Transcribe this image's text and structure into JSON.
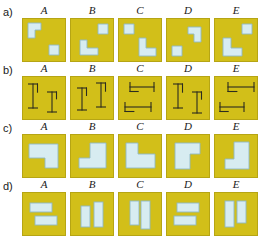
{
  "figure": {
    "title": "",
    "columns": [
      "A",
      "B",
      "C",
      "D",
      "E"
    ],
    "row_labels": [
      "a)",
      "b)",
      "c)",
      "d)"
    ],
    "colors": {
      "tile_fill": "#d2bf19",
      "tile_stroke": "#b6a514",
      "shape_fill": "#d7ecf1",
      "shape_stroke": "#8fb9c4",
      "line_color": "#2b2b20",
      "background": "#ffffff",
      "text": "#1a1a1a"
    },
    "rows": [
      {
        "label": "a)",
        "kind": "small-polyomino-pair",
        "cells": [
          {
            "column": "A",
            "shapes": [
              {
                "name": "l-shape",
                "points": "6,5 19,5 19,12 13,12 13,20 6,20"
              },
              {
                "name": "small-square",
                "points": "27,27 37,27 37,37 27,37"
              }
            ]
          },
          {
            "column": "B",
            "shapes": [
              {
                "name": "small-square",
                "points": "28,6 38,6 38,16 28,16"
              },
              {
                "name": "l-shape",
                "points": "10,22 17,22 17,30 28,30 28,37 10,37"
              }
            ]
          },
          {
            "column": "C",
            "shapes": [
              {
                "name": "small-square",
                "points": "6,6 16,6 16,16 6,16"
              },
              {
                "name": "l-shape",
                "points": "21,20 28,20 28,30 38,30 38,38 21,38"
              }
            ]
          },
          {
            "column": "D",
            "shapes": [
              {
                "name": "l-shape",
                "points": "22,9 35,9 35,24 28,24 28,16 22,16"
              },
              {
                "name": "small-square",
                "points": "6,28 16,28 16,38 6,38"
              }
            ]
          },
          {
            "column": "E",
            "shapes": [
              {
                "name": "small-square",
                "points": "28,6 38,6 38,16 28,16"
              },
              {
                "name": "l-shape",
                "points": "9,20 17,20 17,30 28,30 28,38 9,38"
              }
            ]
          }
        ]
      },
      {
        "label": "b)",
        "kind": "ibeam-pair",
        "cells": [
          {
            "column": "A",
            "beams": [
              {
                "name": "ibeam-vertical",
                "orient": "v",
                "x": 11,
                "y": 8,
                "len": 24,
                "cap": 9
              },
              {
                "name": "ibeam-vertical",
                "orient": "v",
                "x": 30,
                "y": 16,
                "len": 20,
                "cap": 9
              }
            ]
          },
          {
            "column": "B",
            "beams": [
              {
                "name": "ibeam-vertical",
                "orient": "v",
                "x": 12,
                "y": 12,
                "len": 22,
                "cap": 9
              },
              {
                "name": "ibeam-vertical",
                "orient": "v",
                "x": 31,
                "y": 7,
                "len": 24,
                "cap": 9
              }
            ]
          },
          {
            "column": "C",
            "beams": [
              {
                "name": "ibeam-horizontal",
                "orient": "h",
                "x": 12,
                "y": 11,
                "len": 24,
                "cap": 9
              },
              {
                "name": "ibeam-horizontal",
                "orient": "h",
                "x": 7,
                "y": 31,
                "len": 26,
                "cap": 9
              }
            ]
          },
          {
            "column": "D",
            "beams": [
              {
                "name": "ibeam-vertical",
                "orient": "v",
                "x": 12,
                "y": 8,
                "len": 24,
                "cap": 9
              },
              {
                "name": "ibeam-vertical",
                "orient": "v",
                "x": 31,
                "y": 16,
                "len": 21,
                "cap": 9
              }
            ]
          },
          {
            "column": "E",
            "beams": [
              {
                "name": "ibeam-horizontal",
                "orient": "h",
                "x": 14,
                "y": 11,
                "len": 26,
                "cap": 9
              },
              {
                "name": "ibeam-horizontal",
                "orient": "h",
                "x": 6,
                "y": 31,
                "len": 24,
                "cap": 9
              }
            ]
          }
        ]
      },
      {
        "label": "c)",
        "kind": "large-step-polygon",
        "cells": [
          {
            "column": "A",
            "shape": {
              "name": "step-polygon",
              "points": "7,10 36,10 36,34 23,34 23,24 7,24"
            }
          },
          {
            "column": "B",
            "shape": {
              "name": "step-polygon",
              "points": "20,9 36,9 36,34 9,34 9,24 20,24"
            }
          },
          {
            "column": "C",
            "shape": {
              "name": "step-polygon",
              "points": "8,9 20,9 20,20 37,20 37,34 8,34"
            }
          },
          {
            "column": "D",
            "shape": {
              "name": "step-polygon",
              "points": "9,9 34,9 34,20 24,20 24,35 9,35"
            }
          },
          {
            "column": "E",
            "shape": {
              "name": "step-polygon",
              "points": "20,8 35,8 35,35 11,35 11,25 20,25"
            }
          }
        ]
      },
      {
        "label": "d)",
        "kind": "rectangle-pair",
        "cells": [
          {
            "column": "A",
            "rects": [
              {
                "name": "rect-horizontal",
                "x": 8,
                "y": 11,
                "w": 22,
                "h": 9
              },
              {
                "name": "rect-horizontal",
                "x": 13,
                "y": 24,
                "w": 22,
                "h": 9
              }
            ]
          },
          {
            "column": "B",
            "rects": [
              {
                "name": "rect-vertical",
                "x": 11,
                "y": 14,
                "w": 9,
                "h": 21
              },
              {
                "name": "rect-vertical",
                "x": 24,
                "y": 10,
                "w": 9,
                "h": 25
              }
            ]
          },
          {
            "column": "C",
            "rects": [
              {
                "name": "rect-vertical",
                "x": 12,
                "y": 9,
                "w": 9,
                "h": 24
              },
              {
                "name": "rect-vertical",
                "x": 23,
                "y": 9,
                "w": 9,
                "h": 28
              }
            ]
          },
          {
            "column": "D",
            "rects": [
              {
                "name": "rect-horizontal",
                "x": 11,
                "y": 11,
                "w": 22,
                "h": 9
              },
              {
                "name": "rect-horizontal",
                "x": 8,
                "y": 24,
                "w": 22,
                "h": 9
              }
            ]
          },
          {
            "column": "E",
            "rects": [
              {
                "name": "rect-vertical",
                "x": 11,
                "y": 9,
                "w": 9,
                "h": 26
              },
              {
                "name": "rect-vertical",
                "x": 23,
                "y": 9,
                "w": 9,
                "h": 22
              }
            ]
          }
        ]
      }
    ],
    "layout": {
      "tile_size": 44,
      "col_x": [
        22,
        70,
        118,
        166,
        214
      ],
      "row_y": [
        18,
        76,
        134,
        192
      ],
      "head_y": [
        4,
        62,
        120,
        178
      ],
      "label_y": [
        6,
        64,
        122,
        180
      ]
    }
  }
}
